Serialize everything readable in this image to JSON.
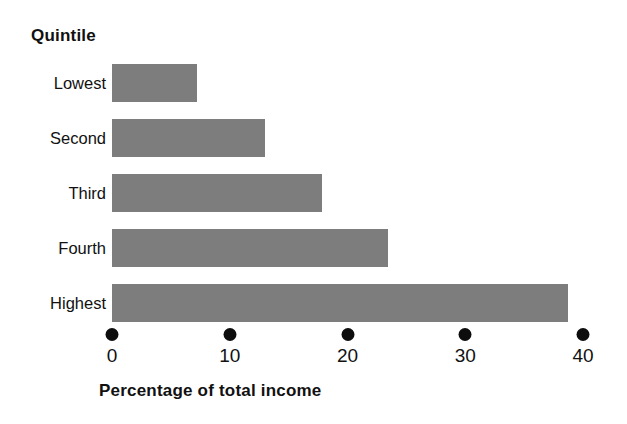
{
  "chart_data": {
    "type": "bar",
    "orientation": "horizontal",
    "title": "",
    "xlabel": "Percentage of total income",
    "ylabel": "Quintile",
    "categories": [
      "Lowest",
      "Second",
      "Third",
      "Fourth",
      "Highest"
    ],
    "values": [
      7.2,
      13.0,
      17.8,
      23.4,
      38.7
    ],
    "xlim": [
      0,
      40
    ],
    "xticks": [
      0,
      10,
      20,
      30,
      40
    ],
    "xtick_labels": [
      "0",
      "10",
      "20",
      "30",
      "40"
    ],
    "grid": false,
    "legend": null,
    "bar_color": "#7d7d7d",
    "tick_marker_color": "#0d0d0d",
    "tick_marker_style": "filled-circle",
    "background_color": "#ffffff",
    "series": [
      {
        "name": "Percentage of total income",
        "values": [
          7.2,
          13.0,
          17.8,
          23.4,
          38.7
        ]
      }
    ]
  },
  "axis": {
    "y_header": "Quintile",
    "x_title": "Percentage of total income"
  }
}
